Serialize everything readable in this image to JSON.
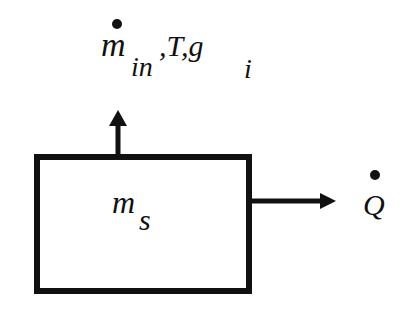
{
  "diagram": {
    "system_box": {
      "label_main": "m",
      "label_sub": "s"
    },
    "inflow": {
      "label_main": "m",
      "label_sub": "in",
      "extra": ",T,g",
      "extra_sub": "i",
      "dot": true
    },
    "heat_out": {
      "label": "Q",
      "dot": true
    },
    "colors": {
      "stroke": "#111111",
      "background": "#ffffff"
    }
  }
}
